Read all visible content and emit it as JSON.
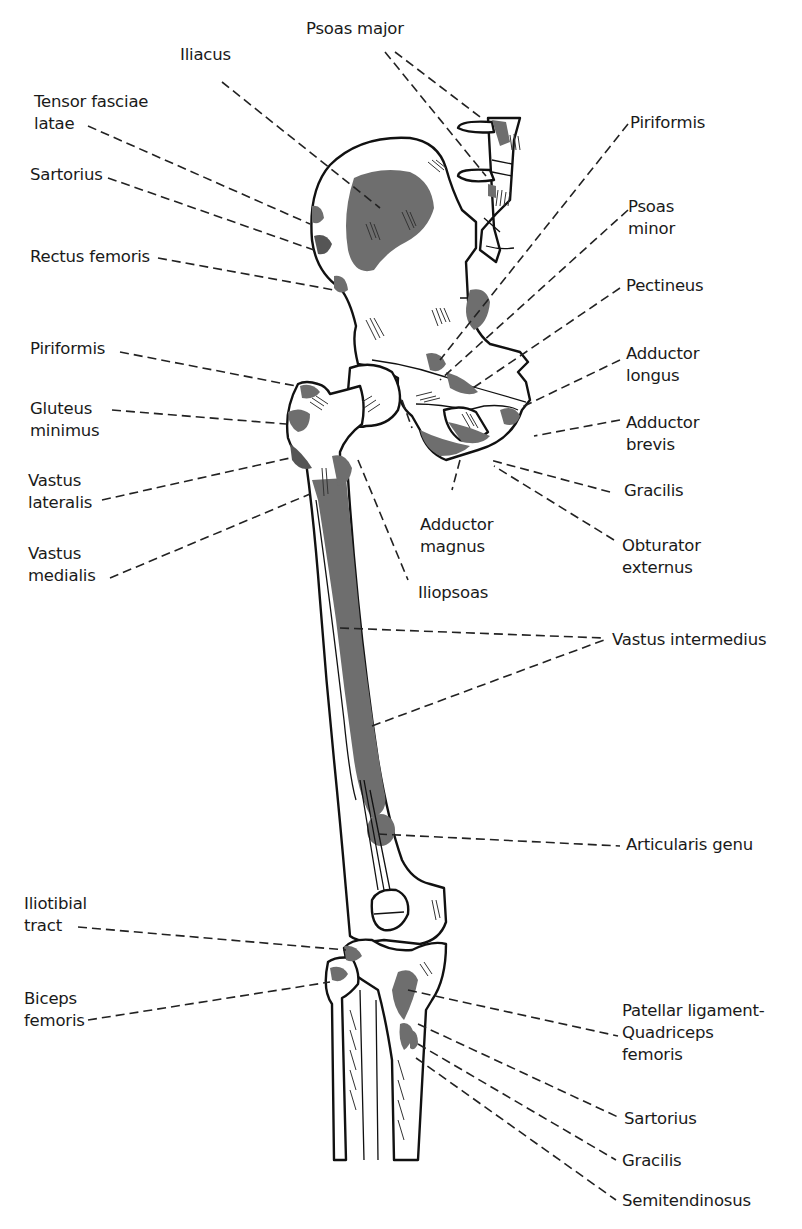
{
  "figure": {
    "colors": {
      "background": "#ffffff",
      "line": "#111111",
      "attachment_fill": "#6e6e6e",
      "label_text": "#1a1a1a"
    },
    "structures": [
      "Pelvis (ilium, pubis, ischium)",
      "Sacrum / lumbar vertebrae",
      "Femur",
      "Patella",
      "Tibia",
      "Fibula"
    ]
  },
  "labels": {
    "left": [
      {
        "id": "iliacus",
        "lines": [
          "Iliacus"
        ]
      },
      {
        "id": "tensor-fasciae-latae",
        "lines": [
          "Tensor fasciae",
          "latae"
        ]
      },
      {
        "id": "sartorius-upper",
        "lines": [
          "Sartorius"
        ]
      },
      {
        "id": "rectus-femoris",
        "lines": [
          "Rectus femoris"
        ]
      },
      {
        "id": "piriformis-left",
        "lines": [
          "Piriformis"
        ]
      },
      {
        "id": "gluteus-minimus",
        "lines": [
          "Gluteus",
          "minimus"
        ]
      },
      {
        "id": "vastus-lateralis",
        "lines": [
          "Vastus",
          "lateralis"
        ]
      },
      {
        "id": "vastus-medialis",
        "lines": [
          "Vastus",
          "medialis"
        ]
      },
      {
        "id": "iliotibial-tract",
        "lines": [
          "Iliotibial",
          "tract"
        ]
      },
      {
        "id": "biceps-femoris",
        "lines": [
          "Biceps",
          "femoris"
        ]
      }
    ],
    "top": [
      {
        "id": "psoas-major",
        "lines": [
          "Psoas major"
        ]
      }
    ],
    "center": [
      {
        "id": "adductor-magnus",
        "lines": [
          "Adductor",
          "magnus"
        ]
      },
      {
        "id": "iliopsoas",
        "lines": [
          "Iliopsoas"
        ]
      }
    ],
    "right": [
      {
        "id": "piriformis-right",
        "lines": [
          "Piriformis"
        ]
      },
      {
        "id": "psoas-minor",
        "lines": [
          "Psoas",
          "minor"
        ]
      },
      {
        "id": "pectineus",
        "lines": [
          "Pectineus"
        ]
      },
      {
        "id": "adductor-longus",
        "lines": [
          "Adductor",
          "longus"
        ]
      },
      {
        "id": "adductor-brevis",
        "lines": [
          "Adductor",
          "brevis"
        ]
      },
      {
        "id": "gracilis-upper",
        "lines": [
          "Gracilis"
        ]
      },
      {
        "id": "obturator-externus",
        "lines": [
          "Obturator",
          "externus"
        ]
      },
      {
        "id": "vastus-intermedius",
        "lines": [
          "Vastus intermedius"
        ]
      },
      {
        "id": "articularis-genu",
        "lines": [
          "Articularis genu"
        ]
      },
      {
        "id": "patellar-ligament",
        "lines": [
          "Patellar ligament-",
          "Quadriceps",
          "femoris"
        ]
      },
      {
        "id": "sartorius-lower",
        "lines": [
          "Sartorius"
        ]
      },
      {
        "id": "gracilis-lower",
        "lines": [
          "Gracilis"
        ]
      },
      {
        "id": "semitendinosus",
        "lines": [
          "Semitendinosus"
        ]
      }
    ]
  }
}
